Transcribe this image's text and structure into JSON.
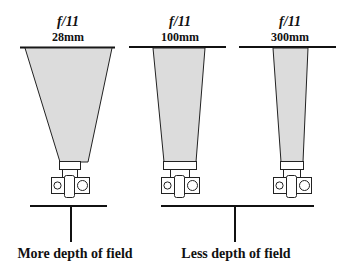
{
  "diagram": {
    "title": "",
    "colors": {
      "line": "#111111",
      "cone_fill": "#dcdcdc",
      "background": "#ffffff"
    },
    "lenses": [
      {
        "aperture": "f/11",
        "focal_length": "28mm"
      },
      {
        "aperture": "f/11",
        "focal_length": "100mm"
      },
      {
        "aperture": "f/11",
        "focal_length": "300mm"
      }
    ],
    "outcomes": [
      {
        "label": "More depth of field"
      },
      {
        "label": "Less depth of field"
      }
    ]
  }
}
